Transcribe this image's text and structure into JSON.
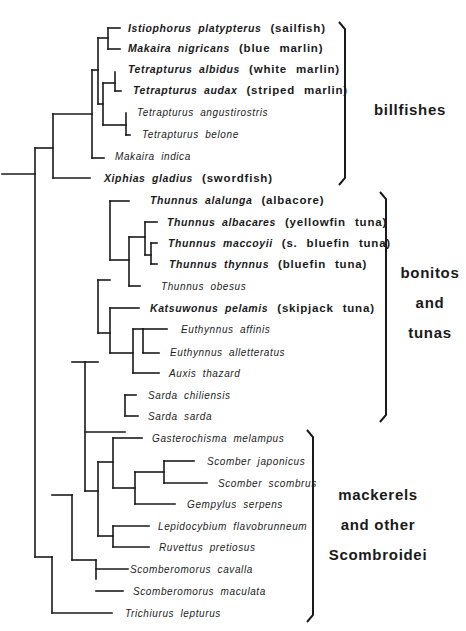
{
  "groups": [
    {
      "name": "billfishes",
      "label_lines": [
        "billfishes"
      ],
      "brace": {
        "x": 345,
        "top": 22,
        "bottom": 185
      }
    },
    {
      "name": "bonitos-and-tunas",
      "label_lines": [
        "bonitos",
        "and",
        "tunas"
      ],
      "brace": {
        "x": 386,
        "top": 192,
        "bottom": 422
      }
    },
    {
      "name": "mackerels-and-other-scombroidei",
      "label_lines": [
        "mackerels",
        "and other",
        "Scombroidei"
      ],
      "brace": {
        "x": 313,
        "top": 430,
        "bottom": 622
      }
    }
  ],
  "leaves": [
    {
      "id": "istiophorus",
      "species": "Istiophorus platypterus",
      "common": "(sailfish)",
      "bold": true,
      "x": 128,
      "y": 28
    },
    {
      "id": "makaira-nigricans",
      "species": "Makaira nigricans",
      "common": "(blue marlin)",
      "bold": true,
      "x": 128,
      "y": 48
    },
    {
      "id": "tetrapturus-albidus",
      "species": "Tetrapturus albidus",
      "common": "(white marlin)",
      "bold": true,
      "x": 128,
      "y": 69
    },
    {
      "id": "tetrapturus-audax",
      "species": "Tetrapturus audax",
      "common": "(striped marlin)",
      "bold": true,
      "x": 133,
      "y": 90
    },
    {
      "id": "tetrapturus-angustirostris",
      "species": "Tetrapturus angustirostris",
      "common": "",
      "bold": false,
      "x": 137,
      "y": 112
    },
    {
      "id": "tetrapturus-belone",
      "species": "Tetrapturus belone",
      "common": "",
      "bold": false,
      "x": 142,
      "y": 134
    },
    {
      "id": "makaira-indica",
      "species": "Makaira indica",
      "common": "",
      "bold": false,
      "x": 115,
      "y": 156
    },
    {
      "id": "xiphias",
      "species": "Xiphias gladius",
      "common": "(swordfish)",
      "bold": true,
      "x": 104,
      "y": 178
    },
    {
      "id": "thunnus-alalunga",
      "species": "Thunnus alalunga",
      "common": "(albacore)",
      "bold": true,
      "x": 150,
      "y": 200
    },
    {
      "id": "thunnus-albacares",
      "species": "Thunnus albacares",
      "common": "(yellowfin tuna)",
      "bold": true,
      "x": 167,
      "y": 222
    },
    {
      "id": "thunnus-maccoyii",
      "species": "Thunnus maccoyii",
      "common": "(s. bluefin tuna)",
      "bold": true,
      "x": 168,
      "y": 243
    },
    {
      "id": "thunnus-thynnus",
      "species": "Thunnus thynnus",
      "common": "(bluefin tuna)",
      "bold": true,
      "x": 169,
      "y": 264
    },
    {
      "id": "thunnus-obesus",
      "species": "Thunnus obesus",
      "common": "",
      "bold": false,
      "x": 161,
      "y": 286
    },
    {
      "id": "katsuwonus",
      "species": "Katsuwonus pelamis",
      "common": "(skipjack tuna)",
      "bold": true,
      "x": 150,
      "y": 308
    },
    {
      "id": "euthynnus-affinis",
      "species": "Euthynnus affinis",
      "common": "",
      "bold": false,
      "x": 181,
      "y": 329
    },
    {
      "id": "euthynnus-alletteratus",
      "species": "Euthynnus alletteratus",
      "common": "",
      "bold": false,
      "x": 170,
      "y": 352
    },
    {
      "id": "auxis",
      "species": "Auxis thazard",
      "common": "",
      "bold": false,
      "x": 169,
      "y": 373
    },
    {
      "id": "sarda-chiliensis",
      "species": "Sarda chiliensis",
      "common": "",
      "bold": false,
      "x": 148,
      "y": 395
    },
    {
      "id": "sarda-sarda",
      "species": "Sarda sarda",
      "common": "",
      "bold": false,
      "x": 148,
      "y": 416
    },
    {
      "id": "gasterochisma",
      "species": "Gasterochisma melampus",
      "common": "",
      "bold": false,
      "x": 152,
      "y": 438
    },
    {
      "id": "scomber-japonicus",
      "species": "Scomber japonicus",
      "common": "",
      "bold": false,
      "x": 207,
      "y": 461
    },
    {
      "id": "scomber-scombrus",
      "species": "Scomber scombrus",
      "common": "",
      "bold": false,
      "x": 218,
      "y": 483
    },
    {
      "id": "gempylus",
      "species": "Gempylus serpens",
      "common": "",
      "bold": false,
      "x": 187,
      "y": 504
    },
    {
      "id": "lepidocybium",
      "species": "Lepidocybium flavobrunneum",
      "common": "",
      "bold": false,
      "x": 158,
      "y": 526
    },
    {
      "id": "ruvettus",
      "species": "Ruvettus pretiosus",
      "common": "",
      "bold": false,
      "x": 159,
      "y": 547
    },
    {
      "id": "scomberomorus-cavalla",
      "species": "Scomberomorus cavalla",
      "common": "",
      "bold": false,
      "x": 130,
      "y": 569
    },
    {
      "id": "scomberomorus-maculata",
      "species": "Scomberomorus maculata",
      "common": "",
      "bold": false,
      "x": 133,
      "y": 591
    },
    {
      "id": "trichiurus",
      "species": "Trichiurus lepturus",
      "common": "",
      "bold": false,
      "x": 125,
      "y": 613
    }
  ],
  "tree_segments": [
    [
      2,
      174,
      35,
      174
    ],
    [
      35,
      148,
      35,
      557
    ],
    [
      35,
      148,
      53,
      148
    ],
    [
      53,
      114,
      53,
      178
    ],
    [
      53,
      178,
      90,
      178
    ],
    [
      53,
      114,
      92,
      114
    ],
    [
      92,
      70,
      92,
      158
    ],
    [
      92,
      158,
      104,
      158
    ],
    [
      92,
      70,
      98,
      70
    ],
    [
      98,
      38,
      98,
      104
    ],
    [
      98,
      38,
      108,
      38
    ],
    [
      108,
      28,
      108,
      49
    ],
    [
      108,
      28,
      120,
      28
    ],
    [
      108,
      49,
      120,
      49
    ],
    [
      98,
      104,
      103,
      104
    ],
    [
      103,
      83,
      103,
      125
    ],
    [
      103,
      83,
      115,
      83
    ],
    [
      115,
      72,
      115,
      91
    ],
    [
      115,
      91,
      121,
      91
    ],
    [
      103,
      125,
      126,
      125
    ],
    [
      126,
      113,
      126,
      135
    ],
    [
      126,
      135,
      130,
      135
    ],
    [
      35,
      557,
      52,
      557
    ],
    [
      52,
      557,
      52,
      613
    ],
    [
      52,
      613,
      112,
      613
    ],
    [
      52,
      495,
      72,
      495
    ],
    [
      72,
      495,
      72,
      560
    ],
    [
      72,
      560,
      96,
      560
    ],
    [
      96,
      560,
      96,
      579
    ],
    [
      96,
      569,
      128,
      569
    ],
    [
      96,
      591,
      123,
      591
    ],
    [
      72,
      362,
      85,
      362
    ],
    [
      85,
      362,
      85,
      491
    ],
    [
      85,
      491,
      98,
      491
    ],
    [
      98,
      462,
      98,
      536
    ],
    [
      98,
      462,
      113,
      462
    ],
    [
      113,
      438,
      113,
      488
    ],
    [
      113,
      438,
      142,
      438
    ],
    [
      113,
      488,
      135,
      488
    ],
    [
      135,
      472,
      135,
      504
    ],
    [
      135,
      504,
      175,
      504
    ],
    [
      135,
      472,
      164,
      472
    ],
    [
      164,
      461,
      164,
      483
    ],
    [
      164,
      461,
      194,
      461
    ],
    [
      164,
      483,
      207,
      483
    ],
    [
      98,
      536,
      113,
      536
    ],
    [
      113,
      526,
      113,
      547
    ],
    [
      113,
      526,
      149,
      526
    ],
    [
      113,
      547,
      149,
      547
    ],
    [
      85,
      432,
      125,
      432
    ],
    [
      125,
      395,
      125,
      416
    ],
    [
      125,
      395,
      136,
      395
    ],
    [
      125,
      416,
      138,
      416
    ],
    [
      85,
      362,
      98,
      362
    ],
    [
      98,
      280,
      98,
      333
    ],
    [
      98,
      280,
      110,
      280
    ],
    [
      110,
      201,
      110,
      260
    ],
    [
      110,
      201,
      129,
      201
    ],
    [
      110,
      260,
      129,
      260
    ],
    [
      129,
      237,
      129,
      286
    ],
    [
      129,
      286,
      140,
      286
    ],
    [
      129,
      237,
      145,
      237
    ],
    [
      145,
      222,
      145,
      255
    ],
    [
      145,
      222,
      157,
      222
    ],
    [
      145,
      255,
      151,
      255
    ],
    [
      151,
      243,
      151,
      264
    ],
    [
      151,
      243,
      157,
      243
    ],
    [
      151,
      264,
      157,
      264
    ],
    [
      98,
      333,
      110,
      333
    ],
    [
      110,
      308,
      110,
      353
    ],
    [
      110,
      308,
      139,
      308
    ],
    [
      110,
      353,
      133,
      353
    ],
    [
      133,
      329,
      133,
      373
    ],
    [
      133,
      373,
      159,
      373
    ],
    [
      133,
      329,
      143,
      329
    ],
    [
      143,
      329,
      143,
      353
    ],
    [
      143,
      329,
      167,
      329
    ],
    [
      143,
      353,
      159,
      353
    ]
  ]
}
